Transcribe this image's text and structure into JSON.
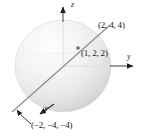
{
  "figure": {
    "type": "math-3d-sphere-diagram",
    "axes": {
      "z_label": "z",
      "y_label": "y",
      "x_label": "x"
    },
    "points": [
      {
        "id": "top",
        "label": "(2, 4, 4)",
        "x": 2,
        "y": 4,
        "z": 4
      },
      {
        "id": "center",
        "label": "(1, 2, 2)",
        "x": 1,
        "y": 2,
        "z": 2
      },
      {
        "id": "bottom",
        "label": "(−2, −4, −4)",
        "x": -2,
        "y": -4,
        "z": -4
      }
    ],
    "colors": {
      "sphere_light": "#fdfdfd",
      "sphere_mid": "#eeeeee",
      "sphere_dark": "#cfcfcf",
      "line": "#808080",
      "axis": "#9a9a9a",
      "text": "#1a1a1a"
    }
  }
}
